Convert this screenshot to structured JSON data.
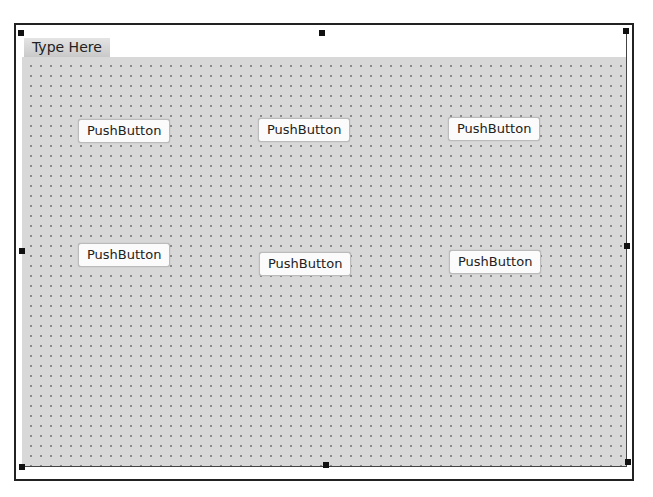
{
  "menubar": {
    "placeholder_label": "Type Here"
  },
  "buttons": [
    {
      "label": "PushButton",
      "x": 78,
      "y": 119
    },
    {
      "label": "PushButton",
      "x": 258,
      "y": 118
    },
    {
      "label": "PushButton",
      "x": 448,
      "y": 117
    },
    {
      "label": "PushButton",
      "x": 78,
      "y": 243
    },
    {
      "label": "PushButton",
      "x": 259,
      "y": 252
    },
    {
      "label": "PushButton",
      "x": 449,
      "y": 250
    }
  ],
  "colors": {
    "grid_bg": "#d8d8d8",
    "frame": "#222222",
    "handle": "#111111"
  }
}
